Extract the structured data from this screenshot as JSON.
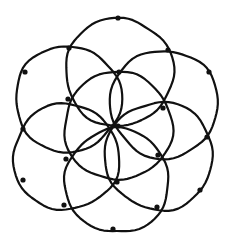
{
  "diagram": {
    "style": "hand-drawn ink sketch",
    "colors": {
      "background": "#ffffff",
      "ink": "#111111"
    },
    "stroke_width": 2.2,
    "dot_radius": 2.6,
    "circles": [
      {
        "id": "center",
        "cx": 118,
        "cy": 126,
        "r": 54
      },
      {
        "id": "top",
        "cx": 119,
        "cy": 72,
        "r": 54
      },
      {
        "id": "upper-right",
        "cx": 164,
        "cy": 104,
        "r": 54
      },
      {
        "id": "lower-right",
        "cx": 159,
        "cy": 156,
        "r": 54
      },
      {
        "id": "bottom",
        "cx": 117,
        "cy": 181,
        "r": 52
      },
      {
        "id": "lower-left",
        "cx": 66,
        "cy": 157,
        "r": 53
      },
      {
        "id": "upper-left",
        "cx": 68,
        "cy": 99,
        "r": 53
      }
    ],
    "dots": [
      {
        "id": "center",
        "x": 118,
        "y": 126
      },
      {
        "id": "inner-top",
        "x": 119,
        "y": 72
      },
      {
        "id": "inner-upper-right",
        "x": 163,
        "y": 108
      },
      {
        "id": "inner-lower-right",
        "x": 158,
        "y": 155
      },
      {
        "id": "inner-bottom",
        "x": 117,
        "y": 182
      },
      {
        "id": "inner-lower-left",
        "x": 66,
        "y": 159
      },
      {
        "id": "inner-upper-left",
        "x": 68,
        "y": 99
      },
      {
        "id": "outer-top",
        "x": 118,
        "y": 18
      },
      {
        "id": "outer-top-right",
        "x": 168,
        "y": 50
      },
      {
        "id": "outer-right-upper",
        "x": 209,
        "y": 72
      },
      {
        "id": "outer-right",
        "x": 207,
        "y": 137
      },
      {
        "id": "outer-right-lower",
        "x": 200,
        "y": 190
      },
      {
        "id": "outer-bottom-right",
        "x": 157,
        "y": 207
      },
      {
        "id": "outer-bottom",
        "x": 113,
        "y": 229
      },
      {
        "id": "outer-bottom-left",
        "x": 64,
        "y": 205
      },
      {
        "id": "outer-left-lower",
        "x": 23,
        "y": 180
      },
      {
        "id": "outer-left",
        "x": 23,
        "y": 129
      },
      {
        "id": "outer-left-upper",
        "x": 25,
        "y": 72
      },
      {
        "id": "outer-top-left",
        "x": 69,
        "y": 48
      }
    ]
  }
}
